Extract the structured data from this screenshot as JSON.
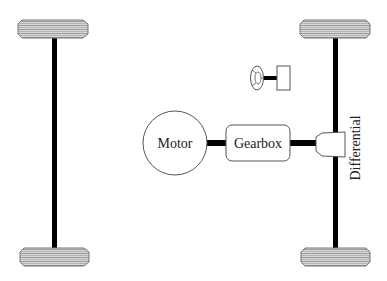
{
  "diagram": {
    "components": {
      "motor": {
        "label": "Motor"
      },
      "gearbox": {
        "label": "Gearbox"
      },
      "differential": {
        "label": "Differential"
      },
      "steering": {
        "label": ""
      }
    },
    "wheels": [
      {
        "id": "front-left"
      },
      {
        "id": "rear-left"
      },
      {
        "id": "front-right"
      },
      {
        "id": "rear-right"
      }
    ],
    "connections": [
      {
        "from": "motor",
        "to": "gearbox"
      },
      {
        "from": "gearbox",
        "to": "differential"
      },
      {
        "from": "differential",
        "to": "right-axle"
      },
      {
        "from": "steering-wheel",
        "to": "steering-box"
      }
    ],
    "colors": {
      "stroke": "#555555",
      "shaft": "#000000",
      "tire_fill": "#cfcfcf",
      "tire_pattern": "#8a8a8a"
    }
  }
}
